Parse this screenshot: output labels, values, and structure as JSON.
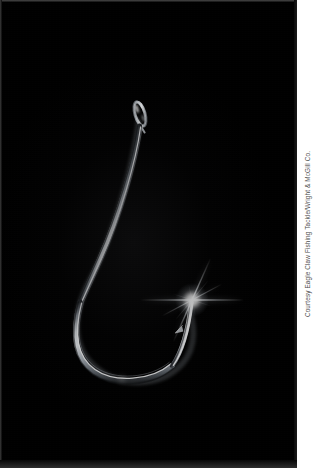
{
  "page": {
    "background_color": "#ffffff",
    "width": 317,
    "height": 468
  },
  "photo": {
    "name": "fishing-hook-photograph",
    "background_color": "#000000",
    "border_color": "#3a3a3a",
    "subject": "fishing hook",
    "subject_color": "#d8dce0",
    "alt_text": "A chrome fishing hook photographed against a black background, with a star-shaped light flare at the hook point"
  },
  "hook": {
    "eye": {
      "label": "hook-eye",
      "cx": 138,
      "cy": 112
    },
    "shank": {
      "label": "hook-shank",
      "from_x": 138,
      "from_y": 126,
      "to_x": 78,
      "to_y": 300
    },
    "bend": {
      "label": "hook-bend",
      "bottom_x": 142,
      "bottom_y": 378
    },
    "point": {
      "label": "hook-point",
      "x": 190,
      "y": 298
    },
    "barb": {
      "label": "hook-barb",
      "x": 178,
      "y": 322
    }
  },
  "flare": {
    "label": "star-flare",
    "center_x": 190,
    "center_y": 298,
    "color": "#ffffff",
    "ray_count": 6
  },
  "caption": {
    "credit": "Courtesy Eagle Claw Fishing Tackle/Wright & McGill Co.",
    "color": "#4c4c4c",
    "orientation": "rotated-90-ccw"
  }
}
